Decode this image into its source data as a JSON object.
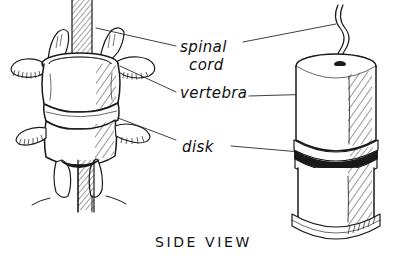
{
  "figure": {
    "caption": "SIDE VIEW",
    "background_color": "#ffffff",
    "ink_color": "#1a1a1a"
  },
  "labels": [
    {
      "id": "spinal-cord",
      "line1": "spinal",
      "line2": "cord",
      "text": "spinal cord"
    },
    {
      "id": "vertebra",
      "line1": "vertebra",
      "line2": "",
      "text": "vertebra"
    },
    {
      "id": "disk",
      "line1": "disk",
      "line2": "",
      "text": "disk"
    }
  ],
  "panels": {
    "left": {
      "name": "anatomical-vertebrae-drawing",
      "description": "Realistic drawing of two stacked vertebrae with spinal cord"
    },
    "right": {
      "name": "schematic-cylinder-drawing",
      "description": "Simplified cylinder model of vertebrae with disk band and cord"
    }
  },
  "icons": {
    "spinal_cord": "spinal-cord-icon",
    "vertebra": "vertebra-icon",
    "disk": "disk-icon"
  }
}
